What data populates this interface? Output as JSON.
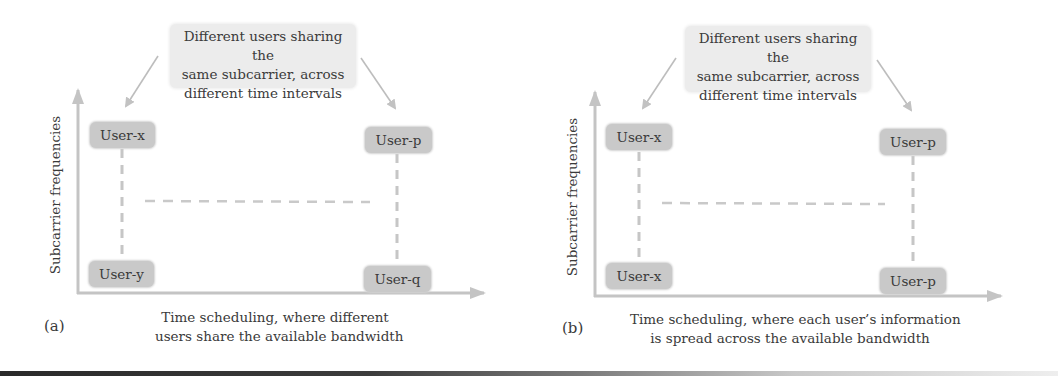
{
  "figure": {
    "panels": [
      {
        "id": "a",
        "panel_label": "(a)",
        "callout": {
          "lines": [
            "Different users sharing the",
            "same subcarrier, across",
            "different time intervals"
          ]
        },
        "y_axis_label": "Subcarrier frequencies",
        "caption": {
          "lines": [
            "Time scheduling, where different",
            "users share the available bandwidth"
          ]
        },
        "users": {
          "top_left": "User-x",
          "top_right": "User-p",
          "bottom_left": "User-y",
          "bottom_right": "User-q"
        }
      },
      {
        "id": "b",
        "panel_label": "(b)",
        "callout": {
          "lines": [
            "Different users sharing the",
            "same subcarrier, across",
            "different time intervals"
          ]
        },
        "y_axis_label": "Subcarrier frequencies",
        "caption": {
          "lines": [
            "Time scheduling, where each user’s information",
            "is spread across the available bandwidth"
          ]
        },
        "users": {
          "top_left": "User-x",
          "top_right": "User-p",
          "bottom_left": "User-x",
          "bottom_right": "User-p"
        }
      }
    ],
    "colors": {
      "axis": "#c4c4c4",
      "arrow": "#bdbdbd",
      "dash": "#c6c6c6",
      "user_box": "#c9c9c9",
      "callout_bg": "#ececec",
      "text": "#3a3a3a"
    },
    "icons": {
      "axis_arrow": "arrow-head-icon",
      "pointer_arrow": "arrow-icon"
    }
  }
}
